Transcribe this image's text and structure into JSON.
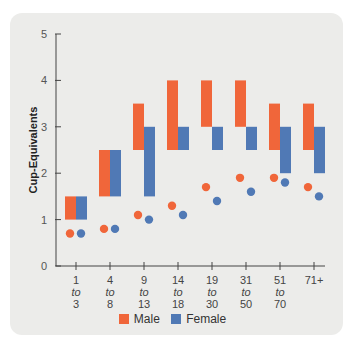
{
  "chart_data": {
    "type": "bar",
    "title": "",
    "xlabel": "",
    "ylabel": "Cup-Equivalents",
    "ylim": [
      0,
      5
    ],
    "yticks": [
      0,
      1,
      2,
      3,
      4,
      5
    ],
    "categories": [
      "1 to 3",
      "4 to 8",
      "9 to 13",
      "14 to 18",
      "19 to 30",
      "31 to 50",
      "51 to 70",
      "71+"
    ],
    "category_lines": [
      [
        "1",
        "to",
        "3"
      ],
      [
        "4",
        "to",
        "8"
      ],
      [
        "9",
        "to",
        "13"
      ],
      [
        "14",
        "to",
        "18"
      ],
      [
        "19",
        "to",
        "30"
      ],
      [
        "31",
        "to",
        "50"
      ],
      [
        "51",
        "to",
        "70"
      ],
      [
        "71+"
      ]
    ],
    "series": [
      {
        "name": "Male",
        "kind": "recommended-range",
        "color": "#f0663a",
        "low": [
          1,
          1.5,
          2.5,
          2.5,
          3,
          3,
          2.5,
          2.5
        ],
        "high": [
          1.5,
          2.5,
          3.5,
          4,
          4,
          4,
          3.5,
          3.5
        ]
      },
      {
        "name": "Female",
        "kind": "recommended-range",
        "color": "#5079b5",
        "low": [
          1,
          1.5,
          1.5,
          2.5,
          2.5,
          2.5,
          2,
          2
        ],
        "high": [
          1.5,
          2.5,
          3,
          3,
          3,
          3,
          3,
          3
        ]
      },
      {
        "name": "Male",
        "kind": "average-intake-dot",
        "color": "#f0663a",
        "values": [
          0.7,
          0.8,
          1.1,
          1.3,
          1.7,
          1.9,
          1.9,
          1.7
        ]
      },
      {
        "name": "Female",
        "kind": "average-intake-dot",
        "color": "#5079b5",
        "values": [
          0.7,
          0.8,
          1.0,
          1.1,
          1.4,
          1.6,
          1.8,
          1.5
        ]
      }
    ],
    "legend": {
      "position": "bottom",
      "entries": [
        {
          "label": "Male",
          "color": "#f0663a"
        },
        {
          "label": "Female",
          "color": "#5079b5"
        }
      ]
    },
    "grid": false
  },
  "legend": {
    "male": "Male",
    "female": "Female"
  },
  "axis": {
    "ylabel": "Cup-Equivalents"
  }
}
